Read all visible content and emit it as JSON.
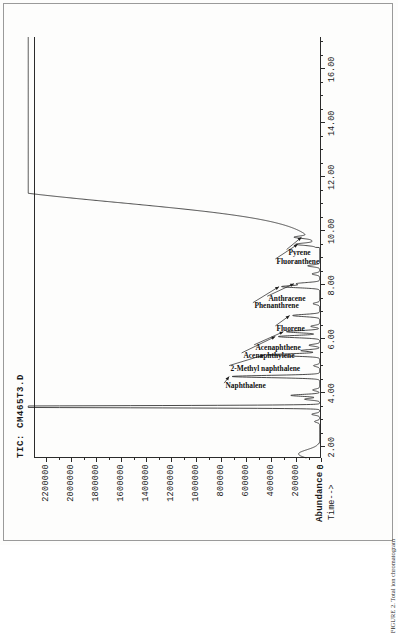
{
  "document": {
    "page_caption": "FIGURE 2. Total ion chromatogram"
  },
  "chart_data": {
    "type": "line",
    "title": "TIC: CM465T3.D",
    "xlabel": "Time-->",
    "ylabel": "Abundance",
    "xlim": [
      1.6,
      17.2
    ],
    "ylim": [
      0,
      2300000
    ],
    "grid": false,
    "legend": null,
    "x_ticks": [
      "2.00",
      "4.00",
      "6.00",
      "8.00",
      "10.00",
      "12.00",
      "14.00",
      "16.00"
    ],
    "x_tick_values": [
      2,
      4,
      6,
      8,
      10,
      12,
      14,
      16
    ],
    "y_ticks": [
      "0",
      "200000",
      "400000",
      "600000",
      "800000",
      "1000000",
      "1200000",
      "1400000",
      "1600000",
      "1800000",
      "2000000",
      "2200000"
    ],
    "y_tick_values": [
      0,
      200000,
      400000,
      600000,
      800000,
      1000000,
      1200000,
      1400000,
      1600000,
      1800000,
      2000000,
      2200000
    ],
    "baseline": 12000,
    "solvent_peak": {
      "label": "solvent",
      "time": 3.5,
      "height": 2300000,
      "clipped": true
    },
    "column_bleed": {
      "onset_time": 10.6,
      "plateau_time": 12.6,
      "height": 2300000,
      "clipped": true
    },
    "peaks": [
      {
        "name": "unlabeled-1",
        "time": 2.95,
        "height": 40000,
        "width": 0.035,
        "annotated": false
      },
      {
        "name": "unlabeled-2",
        "time": 3.22,
        "height": 62000,
        "width": 0.035,
        "annotated": false
      },
      {
        "name": "unlabeled-3",
        "time": 3.78,
        "height": 120000,
        "width": 0.035,
        "annotated": false
      },
      {
        "name": "unlabeled-4",
        "time": 3.92,
        "height": 230000,
        "width": 0.035,
        "annotated": false
      },
      {
        "name": "unlabeled-5",
        "time": 4.12,
        "height": 55000,
        "width": 0.035,
        "annotated": false
      },
      {
        "name": "Naphthalene",
        "time": 4.62,
        "height": 700000,
        "width": 0.04,
        "annotated": true
      },
      {
        "name": "unlabeled-6",
        "time": 5.02,
        "height": 48000,
        "width": 0.035,
        "annotated": false
      },
      {
        "name": "2-Methyl naphthalene",
        "time": 5.42,
        "height": 420000,
        "width": 0.04,
        "annotated": true
      },
      {
        "name": "unlabeled-7",
        "time": 5.58,
        "height": 150000,
        "width": 0.035,
        "annotated": false
      },
      {
        "name": "unlabeled-8",
        "time": 5.78,
        "height": 85000,
        "width": 0.035,
        "annotated": false
      },
      {
        "name": "Acenaphthylene",
        "time": 6.1,
        "height": 330000,
        "width": 0.04,
        "annotated": true
      },
      {
        "name": "Acenaphthene",
        "time": 6.28,
        "height": 265000,
        "width": 0.04,
        "annotated": true
      },
      {
        "name": "unlabeled-9",
        "time": 6.48,
        "height": 70000,
        "width": 0.035,
        "annotated": false
      },
      {
        "name": "Fluorene",
        "time": 6.88,
        "height": 215000,
        "width": 0.04,
        "annotated": true
      },
      {
        "name": "unlabeled-10",
        "time": 7.32,
        "height": 52000,
        "width": 0.035,
        "annotated": false
      },
      {
        "name": "Phenanthrene",
        "time": 7.95,
        "height": 300000,
        "width": 0.04,
        "annotated": true
      },
      {
        "name": "Anthracene",
        "time": 8.06,
        "height": 180000,
        "width": 0.04,
        "annotated": true
      },
      {
        "name": "unlabeled-11",
        "time": 8.42,
        "height": 60000,
        "width": 0.035,
        "annotated": false
      },
      {
        "name": "unlabeled-12",
        "time": 8.72,
        "height": 95000,
        "width": 0.035,
        "annotated": false
      },
      {
        "name": "Fluoranthene",
        "time": 9.52,
        "height": 150000,
        "width": 0.04,
        "annotated": true
      },
      {
        "name": "Pyrene",
        "time": 9.78,
        "height": 120000,
        "width": 0.04,
        "annotated": true
      }
    ],
    "annotations": [
      {
        "label": "Naphthalene",
        "time": 4.62,
        "label_time": 4.3,
        "label_level": 800000,
        "leader": true
      },
      {
        "label": "2-Methyl naphthalene",
        "time": 5.42,
        "label_level": 760000,
        "label_time": 4.95,
        "leader": true
      },
      {
        "label": "Acenaphthylene",
        "time": 6.1,
        "label_level": 660000,
        "label_time": 5.42,
        "leader": true
      },
      {
        "label": "Acenaphthene",
        "time": 6.28,
        "label_level": 560000,
        "label_time": 5.72,
        "leader": true
      },
      {
        "label": "Fluorene",
        "time": 6.88,
        "label_level": 390000,
        "label_time": 6.42,
        "leader": true
      },
      {
        "label": "Phenanthrene",
        "time": 7.95,
        "label_level": 570000,
        "label_time": 7.28,
        "leader": true
      },
      {
        "label": "Anthracene",
        "time": 8.06,
        "label_level": 455000,
        "label_time": 7.52,
        "leader": true
      },
      {
        "label": "Fluoranthene",
        "time": 9.52,
        "label_level": 390000,
        "label_time": 8.9,
        "leader": true
      },
      {
        "label": "Pyrene",
        "time": 9.78,
        "label_level": 300000,
        "label_time": 9.25,
        "leader": true
      }
    ]
  }
}
